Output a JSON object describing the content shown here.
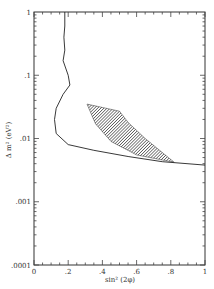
{
  "chart_data": {
    "type": "line",
    "title": "",
    "xlabel": "sin² (2φ)",
    "ylabel": "Δ m² (eV²)",
    "xlim": [
      0,
      1
    ],
    "ylim": [
      0.0001,
      1
    ],
    "yscale": "log",
    "grid": false,
    "legend": null,
    "x_ticks": [
      "0",
      ".2",
      ".4",
      ".6",
      ".8",
      "1"
    ],
    "y_ticks": [
      ".0001",
      ".001",
      ".01",
      ".1",
      "1"
    ],
    "series": [
      {
        "name": "exclusion contour",
        "style": "solid line",
        "points": [
          [
            0.18,
            1.0
          ],
          [
            0.18,
            0.6
          ],
          [
            0.175,
            0.4
          ],
          [
            0.18,
            0.25
          ],
          [
            0.17,
            0.17
          ],
          [
            0.2,
            0.1
          ],
          [
            0.21,
            0.07
          ],
          [
            0.17,
            0.05
          ],
          [
            0.13,
            0.03
          ],
          [
            0.12,
            0.02
          ],
          [
            0.13,
            0.012
          ],
          [
            0.2,
            0.008
          ],
          [
            0.35,
            0.0065
          ],
          [
            0.55,
            0.0052
          ],
          [
            0.75,
            0.0043
          ],
          [
            1.0,
            0.0038
          ]
        ]
      },
      {
        "name": "allowed region",
        "style": "hatched area",
        "polygon": [
          [
            0.31,
            0.035
          ],
          [
            0.5,
            0.027
          ],
          [
            0.55,
            0.018
          ],
          [
            0.65,
            0.01
          ],
          [
            0.82,
            0.0042
          ],
          [
            0.6,
            0.0055
          ],
          [
            0.45,
            0.009
          ],
          [
            0.36,
            0.017
          ],
          [
            0.31,
            0.035
          ]
        ]
      }
    ]
  }
}
